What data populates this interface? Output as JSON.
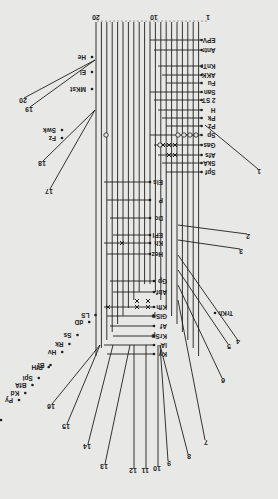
{
  "diagram": {
    "orientation": "rotated-180",
    "top_scale": {
      "left_label": "20",
      "mid_label": "10",
      "right_label": "1"
    },
    "vertical_lines": {
      "count": 20,
      "x_start": 96,
      "x_step": 5.4,
      "top": 22
    },
    "right_labels": [
      {
        "text": "EPV",
        "y": 40
      },
      {
        "text": "Antr",
        "y": 50
      },
      {
        "text": "KnTr",
        "y": 66
      },
      {
        "text": "AKK",
        "y": 75
      },
      {
        "text": "Fu",
        "y": 83
      },
      {
        "text": "San",
        "y": 92
      },
      {
        "text": "2 ST",
        "y": 100
      },
      {
        "text": "H",
        "y": 110
      },
      {
        "text": "Pk",
        "y": 118
      },
      {
        "text": "Pz",
        "y": 126
      },
      {
        "text": "Sp",
        "y": 135
      },
      {
        "text": "Gas",
        "y": 145
      },
      {
        "text": "Afs",
        "y": 155
      },
      {
        "text": "SkA",
        "y": 163
      },
      {
        "text": "Spf",
        "y": 172
      }
    ],
    "middle_labels": [
      {
        "text": "Els",
        "y": 182
      },
      {
        "text": "P",
        "y": 200
      },
      {
        "text": "Dc",
        "y": 218
      },
      {
        "text": "EPI",
        "y": 235
      },
      {
        "text": "Kh",
        "y": 243
      },
      {
        "text": "Hez",
        "y": 254
      },
      {
        "text": "Gp",
        "y": 281
      },
      {
        "text": "Abf",
        "y": 292
      },
      {
        "text": "Kfh",
        "y": 307
      },
      {
        "text": "GlSp",
        "y": 316
      },
      {
        "text": "Af",
        "y": 326
      },
      {
        "text": "KrSp",
        "y": 336
      },
      {
        "text": "lA",
        "y": 345
      },
      {
        "text": "Ky",
        "y": 354
      }
    ],
    "left_labels": [
      {
        "text": "He",
        "y": 57
      },
      {
        "text": "El",
        "y": 72
      },
      {
        "text": "MKst",
        "y": 89
      },
      {
        "text": "Swk",
        "y": 130
      },
      {
        "text": "Fz",
        "y": 138
      },
      {
        "text": "LS",
        "y": 315
      },
      {
        "text": "dD",
        "y": 322
      },
      {
        "text": "Ss",
        "y": 335
      },
      {
        "text": "Rk",
        "y": 344
      },
      {
        "text": "Hv",
        "y": 352
      },
      {
        "text": "Bt",
        "y": 365
      },
      {
        "text": "Spi",
        "y": 378
      },
      {
        "text": "PfH",
        "y": 367
      },
      {
        "text": "BfA",
        "y": 385
      },
      {
        "text": "Kd",
        "y": 393
      },
      {
        "text": "Pu",
        "y": 420
      },
      {
        "text": "Hs",
        "y": 433
      },
      {
        "text": "Gg",
        "y": 440
      },
      {
        "text": "Py",
        "y": 400
      }
    ],
    "branch_numbers": [
      {
        "n": "1",
        "x": 258,
        "y": 175
      },
      {
        "n": "2",
        "x": 247,
        "y": 240
      },
      {
        "n": "3",
        "x": 240,
        "y": 255
      },
      {
        "n": "4",
        "x": 237,
        "y": 345
      },
      {
        "n": "5",
        "x": 228,
        "y": 350
      },
      {
        "n": "6",
        "x": 222,
        "y": 384
      },
      {
        "n": "7",
        "x": 205,
        "y": 446
      },
      {
        "n": "8",
        "x": 188,
        "y": 460
      },
      {
        "n": "9",
        "x": 168,
        "y": 467
      },
      {
        "n": "10",
        "x": 158,
        "y": 472
      },
      {
        "n": "11",
        "x": 146,
        "y": 474
      },
      {
        "n": "12",
        "x": 134,
        "y": 474
      },
      {
        "n": "13",
        "x": 105,
        "y": 470
      },
      {
        "n": "14",
        "x": 88,
        "y": 450
      },
      {
        "n": "15",
        "x": 67,
        "y": 430
      },
      {
        "n": "16",
        "x": 52,
        "y": 410
      },
      {
        "n": "17",
        "x": 50,
        "y": 195
      },
      {
        "n": "18",
        "x": 43,
        "y": 167
      },
      {
        "n": "19",
        "x": 30,
        "y": 113
      },
      {
        "n": "20",
        "x": 24,
        "y": 104
      }
    ],
    "branch_labels": [
      {
        "text": "TrKh",
        "x": 219,
        "y": 313
      }
    ],
    "colors": {
      "ink": "#1e1e1e",
      "paper": "#e8e8e6"
    }
  }
}
